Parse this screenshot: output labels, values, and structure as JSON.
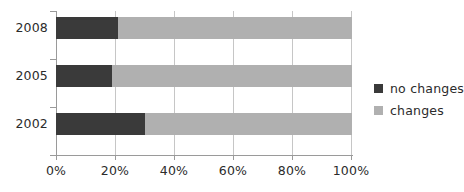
{
  "chart_data": {
    "type": "bar",
    "orientation": "horizontal",
    "stacked": true,
    "normalized": "percent",
    "title": "",
    "subtitle": "",
    "xlabel": "",
    "ylabel": "",
    "categories": [
      "2008",
      "2005",
      "2002"
    ],
    "series": [
      {
        "name": "no changes",
        "values": [
          21,
          19,
          30
        ],
        "color": "#3a3a3a"
      },
      {
        "name": "changes",
        "values": [
          79,
          81,
          70
        ],
        "color": "#b0b0b0"
      }
    ],
    "xlim": [
      0,
      100
    ],
    "xticks": [
      0,
      20,
      40,
      60,
      80,
      100
    ],
    "xticklabels": [
      "0%",
      "20%",
      "40%",
      "60%",
      "80%",
      "100%"
    ],
    "grid": "vertical",
    "legend_position": "right",
    "annotations": []
  },
  "axes": {
    "x": {
      "ticks": [
        {
          "value": 0,
          "label": "0%"
        },
        {
          "value": 20,
          "label": "20%"
        },
        {
          "value": 40,
          "label": "40%"
        },
        {
          "value": 60,
          "label": "60%"
        },
        {
          "value": 80,
          "label": "80%"
        },
        {
          "value": 100,
          "label": "100%"
        }
      ]
    },
    "y": {
      "ticks": [
        {
          "label": "2008"
        },
        {
          "label": "2005"
        },
        {
          "label": "2002"
        }
      ]
    }
  },
  "legend": {
    "items": [
      {
        "label": "no changes",
        "color": "#3a3a3a"
      },
      {
        "label": "changes",
        "color": "#b0b0b0"
      }
    ]
  },
  "colors": {
    "no_changes": "#3a3a3a",
    "changes": "#b0b0b0",
    "gridline": "#c6c6c6",
    "axis": "#9a9a9a",
    "text": "#2b2b2b",
    "background": "#ffffff"
  }
}
